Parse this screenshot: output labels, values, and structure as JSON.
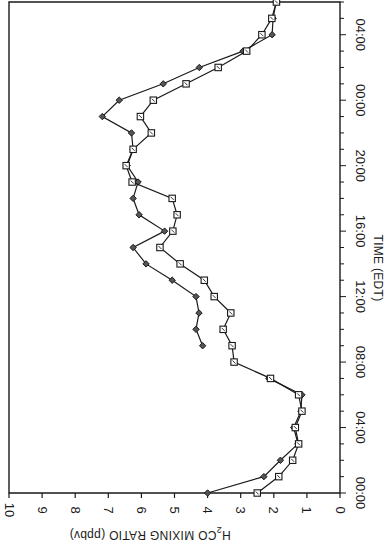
{
  "chart_data": {
    "type": "line",
    "orientation_note": "figure is rotated 90 degrees: time axis vertical on right (increasing upward), mixing ratio horizontal along bottom (increasing leftward)",
    "title": "",
    "xlabel": "TIME (EDT)",
    "ylabel": "H2CO MIXING RATIO (ppbv)",
    "ylabel_parts": {
      "pre": "H",
      "sub": "2",
      "post": "CO MIXING RATIO (ppbv)"
    },
    "xlim_hours": [
      0,
      30
    ],
    "ylim": [
      0,
      10
    ],
    "x_ticks": [
      {
        "hour": 0,
        "label": "00:00"
      },
      {
        "hour": 4,
        "label": "04:00"
      },
      {
        "hour": 8,
        "label": "08:00"
      },
      {
        "hour": 12,
        "label": "12:00"
      },
      {
        "hour": 16,
        "label": "16:00"
      },
      {
        "hour": 20,
        "label": "20:00"
      },
      {
        "hour": 24,
        "label": "00:00"
      },
      {
        "hour": 28,
        "label": "04:00"
      }
    ],
    "y_ticks": [
      0,
      1,
      2,
      3,
      4,
      5,
      6,
      7,
      8,
      9,
      10
    ],
    "grid": false,
    "legend": null,
    "series": [
      {
        "name": "diamond-series",
        "marker": "diamond",
        "segments": [
          {
            "x": [
              0,
              1,
              2,
              3,
              4,
              5,
              6,
              7
            ],
            "values": [
              4.0,
              2.3,
              1.8,
              1.27,
              1.4,
              1.18,
              1.15,
              2.15
            ]
          },
          {
            "x": [
              9,
              10,
              11,
              12,
              13,
              14,
              15,
              16,
              17,
              18,
              19,
              20,
              21,
              22,
              23,
              24,
              25,
              26,
              27,
              28,
              29,
              30
            ],
            "values": [
              4.15,
              4.35,
              4.26,
              4.35,
              5.07,
              5.86,
              6.25,
              5.3,
              6.07,
              6.25,
              6.1,
              6.43,
              6.25,
              6.3,
              7.18,
              6.67,
              5.34,
              4.25,
              2.93,
              2.05,
              2.02,
              1.93
            ]
          }
        ]
      },
      {
        "name": "square-series",
        "marker": "square",
        "segments": [
          {
            "x": [
              0,
              1,
              2,
              3,
              4,
              5,
              6,
              7,
              8,
              9,
              10,
              11,
              12,
              13,
              14,
              15,
              16,
              17,
              18,
              19,
              20,
              21,
              22,
              23,
              24,
              25,
              26,
              27,
              28,
              29,
              30
            ],
            "values": [
              2.5,
              1.85,
              1.43,
              1.25,
              1.35,
              1.15,
              1.25,
              2.1,
              3.2,
              3.26,
              3.53,
              3.3,
              3.8,
              4.1,
              4.83,
              5.44,
              5.05,
              4.92,
              5.07,
              6.28,
              6.46,
              6.25,
              5.7,
              6.03,
              5.64,
              4.65,
              3.68,
              2.82,
              2.36,
              2.06,
              1.92
            ]
          }
        ]
      }
    ]
  },
  "colors": {
    "ink": "#1a1a1a",
    "background": "#ffffff"
  }
}
